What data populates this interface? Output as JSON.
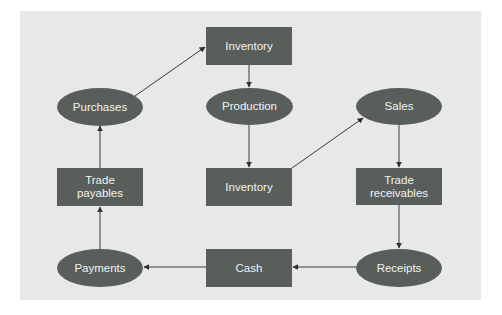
{
  "diagram": {
    "colors": {
      "background": "#e8e8e7",
      "node_fill": "#585f5b",
      "node_text": "#f2f2f2",
      "edge": "#333333"
    },
    "nodes": {
      "inventory_top": {
        "label": "Inventory",
        "shape": "rectangle"
      },
      "production": {
        "label": "Production",
        "shape": "ellipse"
      },
      "inventory_mid": {
        "label": "Inventory",
        "shape": "rectangle"
      },
      "purchases": {
        "label": "Purchases",
        "shape": "ellipse"
      },
      "trade_payables": {
        "label_line1": "Trade",
        "label_line2": "payables",
        "shape": "rectangle"
      },
      "payments": {
        "label": "Payments",
        "shape": "ellipse"
      },
      "cash": {
        "label": "Cash",
        "shape": "rectangle"
      },
      "receipts": {
        "label": "Receipts",
        "shape": "ellipse"
      },
      "trade_receivables": {
        "label_line1": "Trade",
        "label_line2": "receivables",
        "shape": "rectangle"
      },
      "sales": {
        "label": "Sales",
        "shape": "ellipse"
      }
    },
    "edges": [
      {
        "from": "Purchases",
        "to": "Inventory (top)"
      },
      {
        "from": "Inventory (top)",
        "to": "Production"
      },
      {
        "from": "Production",
        "to": "Inventory (middle)"
      },
      {
        "from": "Inventory (middle)",
        "to": "Sales"
      },
      {
        "from": "Sales",
        "to": "Trade receivables"
      },
      {
        "from": "Trade receivables",
        "to": "Receipts"
      },
      {
        "from": "Receipts",
        "to": "Cash"
      },
      {
        "from": "Cash",
        "to": "Payments"
      },
      {
        "from": "Payments",
        "to": "Trade payables"
      },
      {
        "from": "Trade payables",
        "to": "Purchases"
      }
    ]
  }
}
